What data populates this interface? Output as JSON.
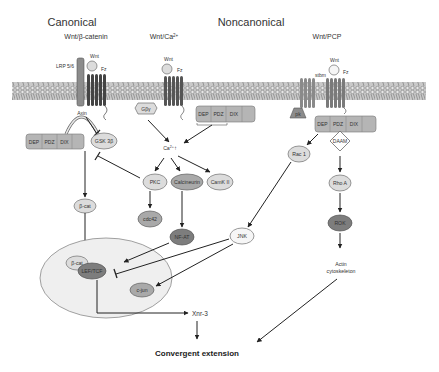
{
  "headers": {
    "canonical": "Canonical",
    "noncanonical": "Noncanonical",
    "pathway_canonical": "Wnt/β-catenin",
    "pathway_ca": "Wnt/Ca",
    "pathway_ca_sup": "2+",
    "pathway_pcp": "Wnt/PCP"
  },
  "receptors": {
    "lrp": "LRP 5/6",
    "wnt": "Wnt",
    "fz": "Fz",
    "stbm": "stbm",
    "pk": "pk",
    "gby": "Gβγ"
  },
  "dishevelled": {
    "domains": [
      "DEP",
      "PDZ",
      "DIX"
    ]
  },
  "nodes": {
    "axin": "Axin",
    "gsk3b": "GSK 3β",
    "ca": "Ca",
    "ca_sup": "2+",
    "ca_arrow": "↑",
    "pkc": "PKC",
    "calcineurin": "Calcineurin",
    "camk2": "CamK II",
    "cdc42": "cdc42",
    "nfat": "NF-AT",
    "bcat": "β-cat",
    "bcat_nuc": "β-cat",
    "leftcf": "LEF/TCF",
    "cjun": "c-jun",
    "jnk": "JNK",
    "rac1": "Rac 1",
    "daam": "DAAM",
    "rhoa": "Rho A",
    "rok": "ROK",
    "actin_line1": "Actin",
    "actin_line2": "cytoskeleton",
    "xnr3": "Xnr-3",
    "convergent": "Convergent extension"
  },
  "colors": {
    "membrane": "#9a9a9a",
    "light_node": "#dcdcdc",
    "mid_node": "#a9a9a9",
    "dark_node": "#7d7d7d",
    "nucleus": "#eeeeee",
    "line": "#222222"
  }
}
